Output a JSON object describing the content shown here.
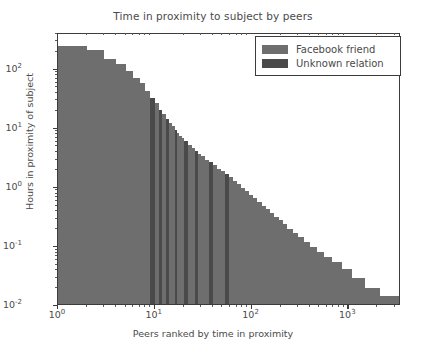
{
  "chart_data": {
    "type": "bar",
    "title": "Time in proximity to subject by peers",
    "xlabel": "Peers ranked by time in proximity",
    "ylabel": "Hours in proximity of subject",
    "xscale": "log",
    "yscale": "log",
    "xlim": [
      1,
      3500
    ],
    "ylim": [
      0.01,
      400
    ],
    "grid": false,
    "legend_position": "upper right",
    "xticks": [
      {
        "value": 1,
        "label": "10",
        "exp": "0"
      },
      {
        "value": 10,
        "label": "10",
        "exp": "1"
      },
      {
        "value": 100,
        "label": "10",
        "exp": "2"
      },
      {
        "value": 1000,
        "label": "10",
        "exp": "3"
      }
    ],
    "yticks": [
      {
        "value": 100,
        "label": "10",
        "exp": "2"
      },
      {
        "value": 10,
        "label": "10",
        "exp": "1"
      },
      {
        "value": 1,
        "label": "10",
        "exp": "0"
      },
      {
        "value": 0.1,
        "label": "10",
        "exp": "-1"
      },
      {
        "value": 0.01,
        "label": "10",
        "exp": "-2"
      }
    ],
    "series": [
      {
        "name": "Facebook friend",
        "color": "#6e6e6e"
      },
      {
        "name": "Unknown relation",
        "color": "#4a4a4a"
      }
    ],
    "bars": [
      {
        "rank": 1,
        "hours": 255,
        "series": 0
      },
      {
        "rank": 2,
        "hours": 212,
        "series": 0
      },
      {
        "rank": 3,
        "hours": 150,
        "series": 0
      },
      {
        "rank": 4,
        "hours": 122,
        "series": 0
      },
      {
        "rank": 5,
        "hours": 96,
        "series": 0
      },
      {
        "rank": 6,
        "hours": 72,
        "series": 0
      },
      {
        "rank": 7,
        "hours": 60,
        "series": 0
      },
      {
        "rank": 8,
        "hours": 44,
        "series": 0
      },
      {
        "rank": 9,
        "hours": 33,
        "series": 1
      },
      {
        "rank": 10,
        "hours": 27,
        "series": 0
      },
      {
        "rank": 11,
        "hours": 21,
        "series": 1
      },
      {
        "rank": 12,
        "hours": 17.5,
        "series": 0
      },
      {
        "rank": 13,
        "hours": 14.5,
        "series": 1
      },
      {
        "rank": 14,
        "hours": 12.5,
        "series": 0
      },
      {
        "rank": 15,
        "hours": 11,
        "series": 0
      },
      {
        "rank": 16,
        "hours": 9.6,
        "series": 1
      },
      {
        "rank": 17,
        "hours": 8.4,
        "series": 0
      },
      {
        "rank": 18,
        "hours": 7.6,
        "series": 0
      },
      {
        "rank": 19,
        "hours": 6.9,
        "series": 0
      },
      {
        "rank": 20,
        "hours": 6.3,
        "series": 1
      },
      {
        "rank": 22,
        "hours": 5.4,
        "series": 0
      },
      {
        "rank": 24,
        "hours": 4.7,
        "series": 0
      },
      {
        "rank": 26,
        "hours": 4.2,
        "series": 1
      },
      {
        "rank": 28,
        "hours": 3.8,
        "series": 0
      },
      {
        "rank": 30,
        "hours": 3.4,
        "series": 0
      },
      {
        "rank": 33,
        "hours": 3.0,
        "series": 0
      },
      {
        "rank": 36,
        "hours": 2.7,
        "series": 1
      },
      {
        "rank": 40,
        "hours": 2.4,
        "series": 0
      },
      {
        "rank": 44,
        "hours": 2.1,
        "series": 0
      },
      {
        "rank": 48,
        "hours": 1.9,
        "series": 0
      },
      {
        "rank": 53,
        "hours": 1.7,
        "series": 1
      },
      {
        "rank": 58,
        "hours": 1.5,
        "series": 0
      },
      {
        "rank": 64,
        "hours": 1.3,
        "series": 0
      },
      {
        "rank": 70,
        "hours": 1.15,
        "series": 0
      },
      {
        "rank": 77,
        "hours": 1.0,
        "series": 0
      },
      {
        "rank": 85,
        "hours": 0.88,
        "series": 0
      },
      {
        "rank": 94,
        "hours": 0.76,
        "series": 0
      },
      {
        "rank": 104,
        "hours": 0.66,
        "series": 0
      },
      {
        "rank": 115,
        "hours": 0.57,
        "series": 0
      },
      {
        "rank": 127,
        "hours": 0.5,
        "series": 0
      },
      {
        "rank": 140,
        "hours": 0.43,
        "series": 0
      },
      {
        "rank": 155,
        "hours": 0.37,
        "series": 0
      },
      {
        "rank": 172,
        "hours": 0.32,
        "series": 0
      },
      {
        "rank": 190,
        "hours": 0.28,
        "series": 0
      },
      {
        "rank": 210,
        "hours": 0.24,
        "series": 0
      },
      {
        "rank": 235,
        "hours": 0.2,
        "series": 0
      },
      {
        "rank": 265,
        "hours": 0.17,
        "series": 0
      },
      {
        "rank": 300,
        "hours": 0.145,
        "series": 0
      },
      {
        "rank": 345,
        "hours": 0.12,
        "series": 0
      },
      {
        "rank": 400,
        "hours": 0.1,
        "series": 0
      },
      {
        "rank": 470,
        "hours": 0.083,
        "series": 0
      },
      {
        "rank": 560,
        "hours": 0.068,
        "series": 0
      },
      {
        "rank": 680,
        "hours": 0.055,
        "series": 0
      },
      {
        "rank": 850,
        "hours": 0.042,
        "series": 0
      },
      {
        "rank": 1100,
        "hours": 0.03,
        "series": 0
      },
      {
        "rank": 1500,
        "hours": 0.02,
        "series": 0
      },
      {
        "rank": 2100,
        "hours": 0.0145,
        "series": 0
      },
      {
        "rank": 3400,
        "hours": 0.0118,
        "series": 0
      }
    ]
  }
}
